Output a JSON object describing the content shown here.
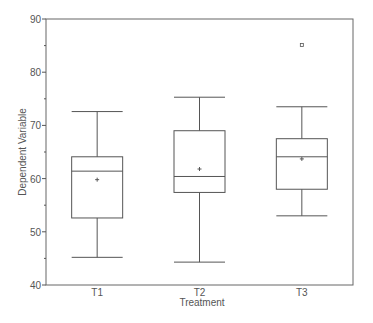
{
  "chart_data": {
    "type": "box",
    "title": "",
    "xlabel": "Treatment",
    "ylabel": "Dependent Variable",
    "ylim": [
      40,
      90
    ],
    "yticks_major": [
      40,
      50,
      60,
      70,
      80,
      90
    ],
    "yticks_minor": [
      45,
      55,
      65,
      75,
      85
    ],
    "grid": false,
    "legend": null,
    "categories": [
      "T1",
      "T2",
      "T3"
    ],
    "series": [
      {
        "name": "T1",
        "whisker_low": 45.2,
        "q1": 52.6,
        "median": 61.4,
        "q3": 64.1,
        "whisker_high": 72.6,
        "mean": 59.8,
        "outliers": []
      },
      {
        "name": "T2",
        "whisker_low": 44.3,
        "q1": 57.4,
        "median": 60.4,
        "q3": 69.0,
        "whisker_high": 75.3,
        "mean": 61.8,
        "outliers": []
      },
      {
        "name": "T3",
        "whisker_low": 53.0,
        "q1": 58.0,
        "median": 64.1,
        "q3": 67.5,
        "whisker_high": 73.5,
        "mean": 63.7,
        "outliers": [
          85.1
        ]
      }
    ],
    "colors": {
      "axis": "#555555",
      "box": "#555555",
      "text": "#555555",
      "background": "#ffffff"
    }
  }
}
